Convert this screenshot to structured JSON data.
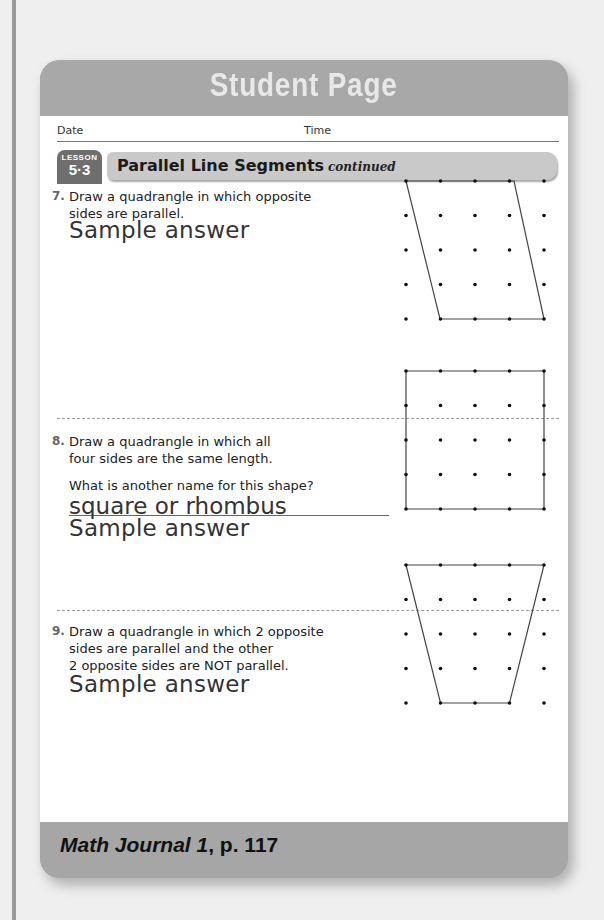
{
  "header": {
    "title": "Student Page"
  },
  "form": {
    "date_label": "Date",
    "time_label": "Time"
  },
  "lesson": {
    "badge_word": "LESSON",
    "badge_number": "5·3",
    "title": "Parallel Line Segments",
    "continued": "continued"
  },
  "problems": [
    {
      "number": "7.",
      "lines": [
        "Draw a quadrangle in which opposite",
        "sides are parallel."
      ],
      "inline_answer": "Sample answer",
      "shape": "parallelogram"
    },
    {
      "number": "8.",
      "lines": [
        "Draw a quadrangle in which all",
        "four sides are the same length."
      ],
      "question": "What is another name for this shape?",
      "answer": "square or rhombus",
      "sample_label": "Sample answer",
      "shape": "square"
    },
    {
      "number": "9.",
      "lines": [
        "Draw a quadrangle in which 2 opposite",
        "sides are parallel and the other",
        "2 opposite sides are NOT parallel."
      ],
      "sample_label": "Sample answer",
      "shape": "trapezoid"
    }
  ],
  "dot_grid": {
    "rows": 5,
    "cols": 5,
    "spacing_px": 34.5
  },
  "footer": {
    "book": "Math Journal 1",
    "page": ", p. 117"
  },
  "colors": {
    "header_bg": "#a8a8a8",
    "title_text": "#e8e8e8",
    "badge_bg": "#6e6e6e",
    "title_bar_bg": "#c9c9c9",
    "footer_bg": "#a6a6a6"
  }
}
